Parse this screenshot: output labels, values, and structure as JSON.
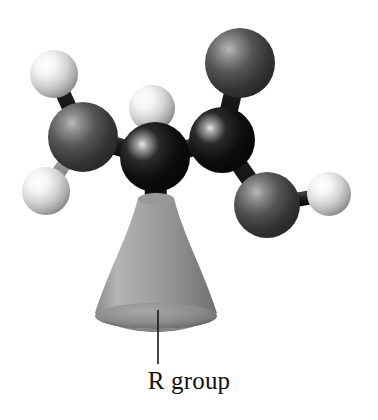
{
  "figure": {
    "type": "molecular-ball-and-stick-model",
    "background_color": "#ffffff",
    "width": 378,
    "height": 420,
    "label": {
      "text": "R group",
      "color": "#111111",
      "leader_line": {
        "x": 158,
        "y_top": 310,
        "y_bottom": 364,
        "color": "#1a1a1a",
        "width": 1.6
      }
    },
    "palette": {
      "hydrogen_light": "#f2f2f2",
      "hydrogen_shadow": "#8e8e8e",
      "carbon_dark_gray": "#4a4a4a",
      "carbon_black": "#0c0c0c",
      "r_group_gray": "#9a9a9a",
      "r_group_shadow": "#6e6e6e",
      "bond_dark": "#1a1a1a",
      "bond_light": "#a8a8a8"
    },
    "atoms": [
      {
        "id": "h-upper-left",
        "element": "H",
        "shade": "light",
        "cx": 54,
        "cy": 74,
        "r": 24
      },
      {
        "id": "h-lower-left",
        "element": "H",
        "shade": "light",
        "cx": 46,
        "cy": 191,
        "r": 24
      },
      {
        "id": "h-top-center",
        "element": "H",
        "shade": "light",
        "cx": 152,
        "cy": 108,
        "r": 23
      },
      {
        "id": "h-far-right",
        "element": "H",
        "shade": "light",
        "cx": 329,
        "cy": 194,
        "r": 22
      },
      {
        "id": "c-left",
        "element": "C",
        "shade": "dark-gray",
        "cx": 83,
        "cy": 137,
        "r": 35
      },
      {
        "id": "c-center",
        "element": "C",
        "shade": "black",
        "cx": 155,
        "cy": 157,
        "r": 35
      },
      {
        "id": "c-right",
        "element": "C",
        "shade": "black",
        "cx": 222,
        "cy": 140,
        "r": 33
      },
      {
        "id": "c-top-right",
        "element": "C",
        "shade": "dark-gray",
        "cx": 240,
        "cy": 63,
        "r": 35
      },
      {
        "id": "c-lower-right",
        "element": "C",
        "shade": "dark-gray",
        "cx": 267,
        "cy": 205,
        "r": 33
      }
    ],
    "bonds": [
      {
        "from": "h-upper-left",
        "to": "c-left",
        "tone": "dark"
      },
      {
        "from": "h-lower-left",
        "to": "c-left",
        "tone": "light"
      },
      {
        "from": "c-left",
        "to": "c-center",
        "tone": "dark"
      },
      {
        "from": "h-top-center",
        "to": "c-center",
        "tone": "light"
      },
      {
        "from": "c-center",
        "to": "c-right",
        "tone": "dark"
      },
      {
        "from": "c-right",
        "to": "c-top-right",
        "tone": "dark"
      },
      {
        "from": "c-right",
        "to": "c-lower-right",
        "tone": "dark"
      },
      {
        "from": "c-lower-right",
        "to": "h-far-right",
        "tone": "dark"
      },
      {
        "from": "c-center",
        "to": "r-group",
        "tone": "dark"
      }
    ],
    "r_group_shape": {
      "id": "r-group",
      "kind": "truncated-cone",
      "apex_x": 156,
      "apex_y": 196,
      "apex_half_width": 18,
      "base_y": 327,
      "base_half_width": 62
    }
  }
}
